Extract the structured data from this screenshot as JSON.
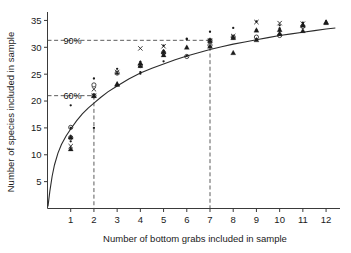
{
  "chart_data": {
    "type": "scatter",
    "title": "",
    "xlabel": "Number of bottom grabs included in sample",
    "ylabel": "Number of species included in sample",
    "xlim": [
      0,
      12.6
    ],
    "ylim": [
      0,
      36.2
    ],
    "xticks": [
      1,
      2,
      3,
      4,
      5,
      6,
      7,
      8,
      9,
      10,
      11,
      12
    ],
    "yticks": [
      5,
      10,
      15,
      20,
      25,
      30,
      35
    ],
    "xtick_labels": [
      "1",
      "2",
      "3",
      "4",
      "5",
      "6",
      "7",
      "8",
      "9",
      "10",
      "11",
      "12"
    ],
    "ytick_labels": [
      "5",
      "10",
      "15",
      "20",
      "25",
      "30",
      "35"
    ],
    "grid": false,
    "legend": "none",
    "curve_label": "fitted species accumulation curve",
    "curve": {
      "x": [
        0.02,
        0.1,
        0.2,
        0.3,
        0.45,
        0.6,
        0.8,
        1.0,
        1.25,
        1.5,
        1.75,
        2.0,
        2.3,
        2.6,
        3.0,
        3.5,
        4.0,
        4.5,
        5.0,
        5.5,
        6.0,
        6.5,
        7.0,
        7.5,
        8.0,
        8.5,
        9.0,
        9.5,
        10.0,
        10.5,
        11.0,
        11.5,
        12.0,
        12.4
      ],
      "y": [
        0.4,
        3.2,
        6.0,
        8.1,
        10.3,
        11.9,
        13.5,
        14.8,
        16.3,
        17.6,
        18.7,
        19.6,
        20.7,
        21.7,
        22.8,
        24.1,
        25.2,
        26.1,
        26.9,
        27.7,
        28.4,
        29.0,
        29.6,
        30.1,
        30.6,
        31.0,
        31.4,
        31.8,
        32.2,
        32.5,
        32.8,
        33.1,
        33.4,
        33.6
      ]
    },
    "reference_lines": [
      {
        "label": "60%",
        "y": 21.0,
        "x": 2.0,
        "style": "dashed"
      },
      {
        "label": "90%",
        "y": 31.3,
        "x": 7.0,
        "style": "dashed"
      }
    ],
    "series": [
      {
        "name": "open circle",
        "marker": "circle",
        "points": [
          [
            1,
            15.1
          ],
          [
            1,
            13.2
          ],
          [
            2,
            23.0
          ],
          [
            2,
            21.0
          ],
          [
            3,
            25.2
          ],
          [
            4,
            26.6
          ],
          [
            5,
            29.0
          ],
          [
            6,
            28.3
          ],
          [
            7,
            31.3
          ],
          [
            7,
            30.4
          ],
          [
            8,
            31.9
          ],
          [
            9,
            31.9
          ],
          [
            10,
            32.2
          ],
          [
            11,
            33.9
          ]
        ]
      },
      {
        "name": "cross",
        "marker": "cross",
        "points": [
          [
            1,
            11.6
          ],
          [
            2,
            22.2
          ],
          [
            2,
            21.0
          ],
          [
            3,
            25.4
          ],
          [
            4,
            29.8
          ],
          [
            5,
            30.2
          ],
          [
            7,
            31.2
          ],
          [
            8,
            32.1
          ],
          [
            9,
            34.7
          ],
          [
            10,
            34.5
          ],
          [
            11,
            34.4
          ]
        ]
      },
      {
        "name": "triangle",
        "marker": "triangle",
        "points": [
          [
            1,
            13.3
          ],
          [
            1,
            11.1
          ],
          [
            2,
            21.0
          ],
          [
            3,
            23.2
          ],
          [
            3,
            23.1
          ],
          [
            4,
            27.1
          ],
          [
            4,
            26.6
          ],
          [
            5,
            29.2
          ],
          [
            5,
            28.6
          ],
          [
            6,
            30.0
          ],
          [
            7,
            31.3
          ],
          [
            7,
            30.2
          ],
          [
            8,
            31.8
          ],
          [
            8,
            29.0
          ],
          [
            9,
            33.2
          ],
          [
            9,
            31.4
          ],
          [
            10,
            33.3
          ],
          [
            10,
            32.6
          ],
          [
            11,
            34.1
          ],
          [
            11,
            33.1
          ],
          [
            12,
            34.7
          ],
          [
            12,
            34.6
          ]
        ]
      },
      {
        "name": "dot",
        "marker": "dot",
        "points": [
          [
            1,
            19.2
          ],
          [
            1,
            15.0
          ],
          [
            1,
            12.5
          ],
          [
            2,
            24.2
          ],
          [
            2,
            21.1
          ],
          [
            2,
            15.0
          ],
          [
            3,
            26.0
          ],
          [
            3,
            25.1
          ],
          [
            4,
            27.3
          ],
          [
            4,
            25.4
          ],
          [
            4,
            25.1
          ],
          [
            5,
            30.3
          ],
          [
            5,
            29.4
          ],
          [
            5,
            27.4
          ],
          [
            6,
            31.6
          ],
          [
            6,
            31.5
          ],
          [
            6,
            30.0
          ],
          [
            6,
            28.4
          ],
          [
            7,
            32.9
          ],
          [
            7,
            31.4
          ],
          [
            8,
            33.6
          ],
          [
            8,
            32.0
          ],
          [
            9,
            34.8
          ],
          [
            9,
            33.2
          ],
          [
            9,
            31.5
          ],
          [
            10,
            34.1
          ],
          [
            10,
            33.5
          ],
          [
            10,
            32.3
          ],
          [
            11,
            34.6
          ],
          [
            11,
            34.4
          ],
          [
            11,
            34.1
          ],
          [
            12,
            34.7
          ],
          [
            12,
            34.6
          ],
          [
            12,
            34.8
          ]
        ]
      }
    ]
  },
  "axes": {
    "x_title": "Number of bottom grabs included in sample",
    "y_title": "Number of species included in sample"
  },
  "annotations": {
    "pct60": "60%",
    "pct90": "90%"
  }
}
